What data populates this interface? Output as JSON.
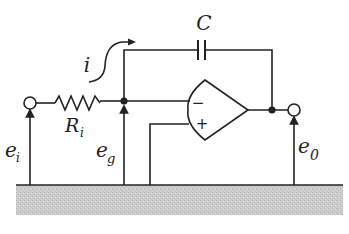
{
  "diagram": {
    "type": "op-amp integrator circuit",
    "labels": {
      "capacitor": "C",
      "current": "i",
      "resistor_main": "R",
      "resistor_sub": "i",
      "input_voltage_main": "e",
      "input_voltage_sub": "i",
      "node_voltage_main": "e",
      "node_voltage_sub": "g",
      "output_voltage_main": "e",
      "output_voltage_sub": "0",
      "inverting_input": "−",
      "noninverting_input": "+"
    },
    "colors": {
      "stroke": "#222222",
      "ground": "#c8c8c8",
      "background": "#ffffff"
    }
  }
}
